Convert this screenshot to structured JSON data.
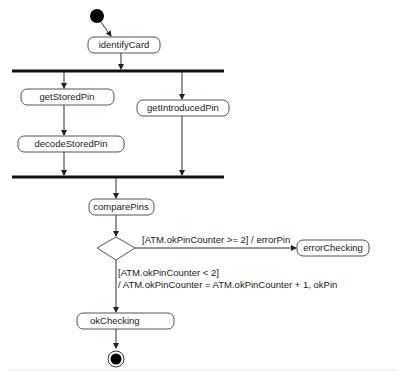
{
  "diagram": {
    "type": "uml-activity",
    "nodes": {
      "identifyCard": "identifyCard",
      "getStoredPin": "getStoredPin",
      "getIntroducedPin": "getIntroducedPin",
      "decodeStoredPin": "decodeStoredPin",
      "comparePins": "comparePins",
      "errorChecking": "errorChecking",
      "okChecking": "okChecking"
    },
    "guards": {
      "error_guard": "[ATM.okPinCounter >= 2] / errorPin",
      "ok_guard_line1": "[ATM.okPinCounter < 2]",
      "ok_guard_line2": "/ ATM.okPinCounter = ATM.okPinCounter + 1, okPin"
    },
    "colors": {
      "stroke": "#555555",
      "bar": "#111111",
      "initial": "#000000"
    }
  }
}
